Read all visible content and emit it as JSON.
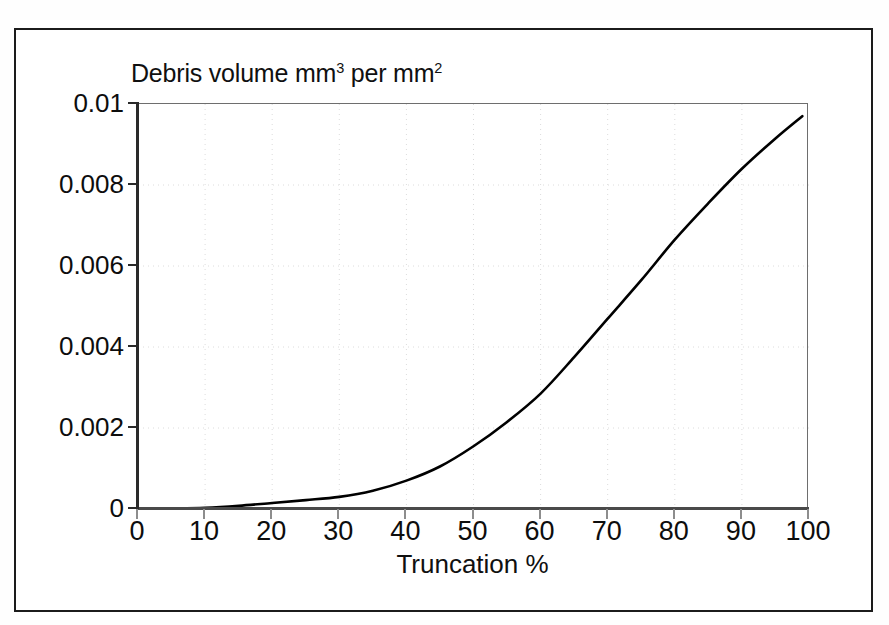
{
  "figure": {
    "frame_border_color": "#1b1b1b",
    "background_color": "#ffffff"
  },
  "chart_title_parts": {
    "lead": "Debris volume mm",
    "sup1": "3",
    "mid": " per mm",
    "sup2": "2"
  },
  "chart_data": {
    "type": "line",
    "title": "Debris volume mm3 per mm2",
    "xlabel": "Truncation %",
    "ylabel": "",
    "xlim": [
      0,
      100
    ],
    "ylim": [
      0,
      0.01
    ],
    "grid": true,
    "grid_color": "#dcdcdc",
    "grid_style": "dotted",
    "legend": "none",
    "line_color": "#000000",
    "line_width": 2.6,
    "xticks": [
      0,
      10,
      20,
      30,
      40,
      50,
      60,
      70,
      80,
      90,
      100
    ],
    "xtick_labels": [
      "0",
      "10",
      "20",
      "30",
      "40",
      "50",
      "60",
      "70",
      "80",
      "90",
      "100"
    ],
    "yticks": [
      0,
      0.002,
      0.004,
      0.006,
      0.008,
      0.01
    ],
    "ytick_labels": [
      "0",
      "0.002",
      "0.004",
      "0.006",
      "0.008",
      "0.01"
    ],
    "x": [
      0,
      5,
      10,
      15,
      20,
      25,
      30,
      35,
      40,
      45,
      50,
      55,
      60,
      65,
      70,
      75,
      80,
      85,
      90,
      95,
      99
    ],
    "values": [
      0,
      1e-05,
      3e-05,
      8e-05,
      0.00015,
      0.00022,
      0.0003,
      0.00045,
      0.0007,
      0.00105,
      0.00155,
      0.00215,
      0.00285,
      0.00375,
      0.0047,
      0.00565,
      0.00665,
      0.00755,
      0.0084,
      0.00915,
      0.0097
    ],
    "annotations": []
  },
  "axis_titles": {
    "x": "Truncation %"
  }
}
